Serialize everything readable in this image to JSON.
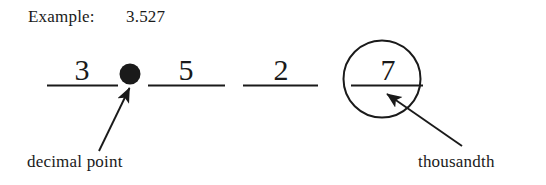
{
  "figure": {
    "background_color": "#ffffff",
    "ink_color": "#1a1a1a",
    "header": {
      "label": "Example:",
      "value": "3.527"
    },
    "place_value_blanks": [
      {
        "digit": "3",
        "name": "ones-digit"
      },
      {
        "digit": "5",
        "name": "tenths-digit"
      },
      {
        "digit": "2",
        "name": "hundredths-digit"
      },
      {
        "digit": "7",
        "name": "thousandths-digit"
      }
    ],
    "decimal_point_marker": "•",
    "annotations": [
      {
        "text": "decimal point",
        "points_to": "decimal-point-marker"
      },
      {
        "text": "thousandth",
        "points_to": "thousandths-digit"
      }
    ]
  }
}
